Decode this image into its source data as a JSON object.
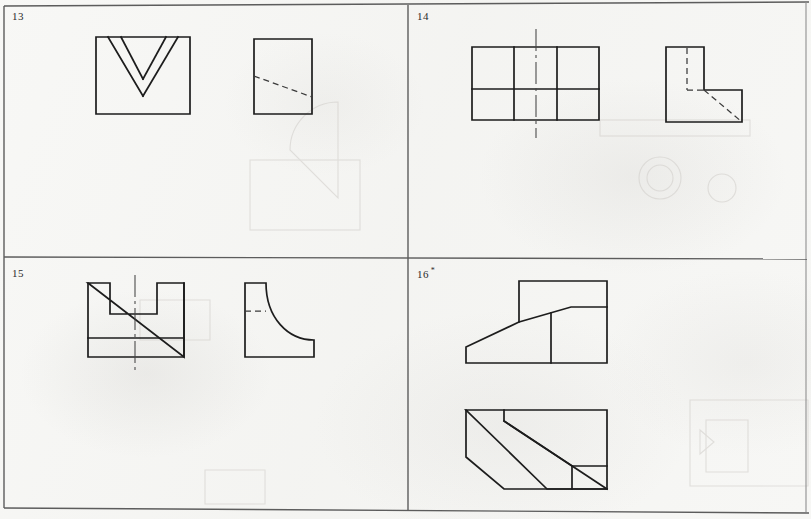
{
  "sheet": {
    "width": 811,
    "height": 519,
    "background_color": "#f7f7f5",
    "line_color": "#1d1d1d",
    "border_color": "#5c5c5c",
    "hidden_line_color": "#3a3a3a",
    "center_line_color": "#454545",
    "description": "Engineering-drawing worksheet: four numbered exercise panels, each holding orthographic views of a part drawn with visible, hidden and centre lines."
  },
  "layout": {
    "columns": 2,
    "rows": 2,
    "vertical_divider_x": 408,
    "horizontal_divider_y": 258
  },
  "panels": [
    {
      "id": "panel-13",
      "number": "13",
      "marker": "",
      "position": "top-left",
      "views": [
        {
          "name": "front-view-vee-block",
          "type": "outline-with-vee-groove",
          "outline": "rectangle with a V shaped groove cut into the top edge",
          "has_hidden_lines": false,
          "has_center_line": false
        },
        {
          "name": "side-view-square",
          "type": "square-with-diagonal-hidden-line",
          "outline": "square",
          "has_hidden_lines": true,
          "has_center_line": false
        }
      ]
    },
    {
      "id": "panel-14",
      "number": "14",
      "marker": "",
      "position": "top-right",
      "views": [
        {
          "name": "front-view-grid",
          "type": "rectangle-divided-3x2",
          "outline": "rectangle split into three columns and two rows",
          "has_hidden_lines": false,
          "has_center_line": true
        },
        {
          "name": "side-view-ell",
          "type": "ell-shape-with-hidden-lines",
          "outline": "L shaped profile",
          "has_hidden_lines": true,
          "has_center_line": false
        }
      ]
    },
    {
      "id": "panel-15",
      "number": "15",
      "marker": "",
      "position": "bottom-left",
      "views": [
        {
          "name": "front-view-slotted-base",
          "type": "rectangle-with-u-slot-and-base",
          "outline": "rectangle with a U shaped slot in the top and a base plate band at the bottom",
          "has_hidden_lines": false,
          "has_center_line": true
        },
        {
          "name": "side-view-fillet",
          "type": "ell-shape-with-concave-fillet",
          "outline": "L profile whose inner corner is a large concave radius",
          "has_hidden_lines": true,
          "has_center_line": false
        }
      ]
    },
    {
      "id": "panel-16",
      "number": "16",
      "marker": "*",
      "position": "bottom-right",
      "views": [
        {
          "name": "front-view-wedge",
          "type": "rectangle-with-inclined-face",
          "outline": "tall block with a long inclined face falling to the left and a vertical division line",
          "has_hidden_lines": false,
          "has_center_line": false
        },
        {
          "name": "top-view-wedge",
          "type": "rectangle-with-chamfered-corners-and-band",
          "outline": "rectangle with chamfered left and bottom corners crossed by two parallel inclined lines",
          "has_hidden_lines": false,
          "has_center_line": false
        }
      ]
    }
  ]
}
